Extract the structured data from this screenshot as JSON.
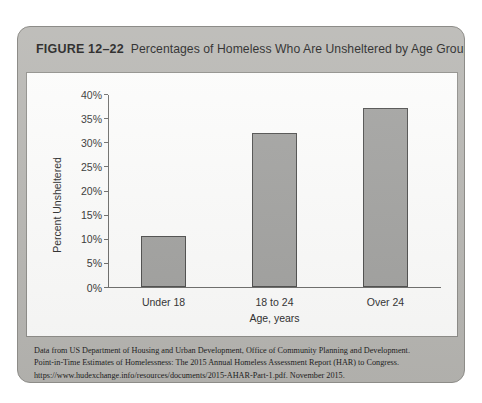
{
  "figure": {
    "number_label": "FIGURE 12–22",
    "title": "Percentages of Homeless Who Are Unsheltered by Age Group",
    "source_lines": [
      "Data from US Department of Housing and Urban Development, Office of Community Planning and Development.",
      "Point-in-Time Estimates of Homelessness: The 2015 Annual Homeless Assessment Report (HAR) to Congress.",
      "https://www.hudexchange.info/resources/documents/2015-AHAR-Part-1.pdf. November 2015."
    ]
  },
  "colors": {
    "card_background": "#b8b7b3",
    "panel_background": "#fdfdfc",
    "bar_fill": "#a3a3a1",
    "bar_border": "#4f4f4e",
    "axis": "#6e6e6c",
    "text": "#1d1d1d"
  },
  "chart_data": {
    "type": "bar",
    "title": "Percentages of Homeless Who Are Unsheltered by Age Group",
    "categories": [
      "Under 18",
      "18 to 24",
      "Over 24"
    ],
    "values": [
      10.5,
      32,
      37
    ],
    "xlabel": "Age, years",
    "ylabel": "Percent Unsheltered",
    "ylim": [
      0,
      40
    ],
    "ytick_step": 5,
    "ytick_labels": [
      "0%",
      "5%",
      "10%",
      "15%",
      "20%",
      "25%",
      "30%",
      "35%",
      "40%"
    ],
    "ytick_values": [
      0,
      5,
      10,
      15,
      20,
      25,
      30,
      35,
      40
    ],
    "grid": false,
    "legend": "none",
    "value_suffix": "%"
  }
}
